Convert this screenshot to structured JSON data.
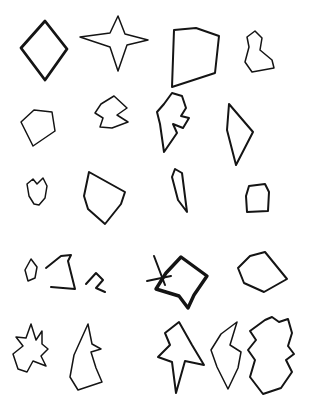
{
  "page": {
    "background_color": "#ffffff",
    "ink_color": "#141414",
    "width": 309,
    "height": 404,
    "rows": 5,
    "columns": 4,
    "shape_count": 20
  },
  "shapes": [
    {
      "id": "shape-r1c1",
      "name": "diamond",
      "row": 1,
      "column": 1,
      "stroke_weight": "bold",
      "closed": true,
      "bbox": [
        21,
        20,
        68,
        81
      ],
      "points": "45,21 67,49 45,80 21,48"
    },
    {
      "id": "shape-r1c2",
      "name": "four-point-star",
      "row": 1,
      "column": 2,
      "stroke_weight": "thin",
      "closed": true,
      "bbox": [
        79,
        14,
        150,
        73
      ],
      "points": "118,16 125,34 148,40 127,45 118,71 110,47 80,37 110,33"
    },
    {
      "id": "shape-r1c3",
      "name": "curved-quadrilateral",
      "row": 1,
      "column": 3,
      "stroke_weight": "med",
      "closed": true,
      "bbox": [
        169,
        27,
        222,
        90
      ],
      "points": "174,30 196,28 219,36 215,73 172,87"
    },
    {
      "id": "shape-r1c4",
      "name": "small-lobed-blob",
      "row": 1,
      "column": 4,
      "stroke_weight": "thin",
      "closed": true,
      "bbox": [
        243,
        29,
        278,
        75
      ],
      "points": "255,31 262,38 260,50 272,60 274,68 252,72 245,62 249,47 247,37"
    },
    {
      "id": "shape-r2c1",
      "name": "tilted-quadrilateral",
      "row": 2,
      "column": 1,
      "stroke_weight": "thin",
      "closed": true,
      "bbox": [
        18,
        106,
        58,
        149
      ],
      "points": "34,110 52,112 55,131 33,146 21,122"
    },
    {
      "id": "shape-r2c2",
      "name": "notched-arrow-blob",
      "row": 2,
      "column": 2,
      "stroke_weight": "thin",
      "closed": true,
      "bbox": [
        93,
        93,
        131,
        131
      ],
      "points": "114,96 127,108 117,115 128,122 112,128 100,127 103,118 95,113 101,104"
    },
    {
      "id": "shape-r2c3",
      "name": "double-lobe-with-inner-notch",
      "row": 2,
      "column": 3,
      "stroke_weight": "med",
      "closed": true,
      "bbox": [
        154,
        90,
        194,
        156
      ],
      "points": "172,93 182,96 186,108 181,116 189,118 183,128 173,124 177,133 164,152 160,124 157,112 164,104"
    },
    {
      "id": "shape-r2c4",
      "name": "narrow-triangle",
      "row": 2,
      "column": 4,
      "stroke_weight": "med",
      "closed": true,
      "bbox": [
        224,
        99,
        257,
        169
      ],
      "points": "229,104 253,132 236,165 227,130"
    },
    {
      "id": "shape-r3c1",
      "name": "small-hook-blob",
      "row": 3,
      "column": 1,
      "stroke_weight": "thin",
      "closed": true,
      "bbox": [
        23,
        175,
        51,
        208
      ],
      "points": "33,179 37,184 43,178 47,186 45,198 39,205 34,204 29,196 27,184"
    },
    {
      "id": "shape-r3c2",
      "name": "kite-pentagon",
      "row": 3,
      "column": 2,
      "stroke_weight": "med",
      "closed": true,
      "bbox": [
        80,
        168,
        129,
        228
      ],
      "points": "89,172 125,192 121,204 105,224 88,209 84,196"
    },
    {
      "id": "shape-r3c3",
      "name": "thin-sliver",
      "row": 3,
      "column": 3,
      "stroke_weight": "med",
      "closed": true,
      "bbox": [
        168,
        165,
        192,
        217
      ],
      "points": "175,169 182,173 187,212 178,200 172,177"
    },
    {
      "id": "shape-r3c4",
      "name": "rounded-rectangle",
      "row": 3,
      "column": 4,
      "stroke_weight": "med",
      "closed": true,
      "bbox": [
        241,
        181,
        274,
        216
      ],
      "points": "249,186 265,184 269,192 268,211 247,212 246,196"
    },
    {
      "id": "shape-r4c1",
      "name": "tiny-lozenge",
      "row": 4,
      "column": 1,
      "stroke_weight": "thin",
      "closed": true,
      "bbox": [
        23,
        256,
        41,
        284
      ],
      "points": "31,259 37,267 35,278 28,281 25,270"
    },
    {
      "id": "shape-r4c2",
      "name": "open-angular-sweep",
      "row": 4,
      "column": 2,
      "stroke_weight": "med",
      "closed": false,
      "bbox": [
        44,
        253,
        82,
        292
      ],
      "points": "46,268 61,256 71,255 68,261 75,289 51,287"
    },
    {
      "id": "shape-r4c3",
      "name": "small-open-hook",
      "row": 4,
      "column": 3,
      "stroke_weight": "med",
      "closed": false,
      "bbox": [
        85,
        271,
        108,
        296
      ],
      "points": "86,284 96,273 103,280 96,288 105,292"
    },
    {
      "id": "shape-r4c4",
      "name": "bold-polygon-with-tail",
      "row": 4,
      "column": 4,
      "stroke_weight": "xbold",
      "closed": true,
      "bbox": [
        147,
        252,
        212,
        310
      ],
      "points": "181,257 207,276 194,295 188,308 179,296 156,289 166,273"
    },
    {
      "id": "shape-r4c4-tail",
      "name": "crossing-tail-stroke",
      "row": 4,
      "column": 4,
      "stroke_weight": "med",
      "closed": false,
      "bbox": [
        146,
        254,
        174,
        286
      ],
      "points": "154,256 165,285"
    },
    {
      "id": "shape-r4c4-tail2",
      "name": "crossing-tail-stroke-horizontal",
      "row": 4,
      "column": 4,
      "stroke_weight": "med",
      "closed": false,
      "bbox": [
        146,
        275,
        172,
        284
      ],
      "points": "147,281 171,276"
    },
    {
      "id": "shape-r4c5",
      "name": "fan-quadrilateral",
      "row": 4,
      "column": 5,
      "stroke_weight": "med",
      "closed": true,
      "bbox": [
        235,
        251,
        290,
        295
      ],
      "points": "250,256 265,252 287,279 264,292 244,283 238,268"
    },
    {
      "id": "shape-r5c1",
      "name": "jagged-star-blob",
      "row": 5,
      "column": 1,
      "stroke_weight": "thin",
      "closed": true,
      "bbox": [
        11,
        320,
        52,
        382
      ],
      "points": "31,324 36,340 42,331 42,344 48,349 41,356 46,366 33,361 27,372 18,369 13,354 23,346 16,337 26,338"
    },
    {
      "id": "shape-r5c2",
      "name": "tall-spike-blob",
      "row": 5,
      "column": 2,
      "stroke_weight": "thin",
      "closed": true,
      "bbox": [
        66,
        320,
        106,
        392
      ],
      "points": "88,324 92,344 101,349 91,352 96,368 102,382 78,390 70,377 74,355"
    },
    {
      "id": "shape-r5c3",
      "name": "five-point-star-blob",
      "row": 5,
      "column": 3,
      "stroke_weight": "med",
      "closed": true,
      "bbox": [
        156,
        318,
        206,
        396
      ],
      "points": "179,322 192,345 204,365 185,361 176,393 172,362 158,357 170,345 165,333"
    },
    {
      "id": "shape-r5c4",
      "name": "v-notched-blob",
      "row": 5,
      "column": 4,
      "stroke_weight": "thin",
      "closed": true,
      "bbox": [
        209,
        318,
        248,
        392
      ],
      "points": "237,322 230,345 241,352 238,368 228,389 217,367 211,350 221,334"
    },
    {
      "id": "shape-r5c5",
      "name": "large-lumpy-blob",
      "row": 5,
      "column": 5,
      "stroke_weight": "med",
      "closed": true,
      "bbox": [
        245,
        315,
        296,
        398
      ],
      "points": "265,320 272,317 279,322 288,319 292,333 288,346 294,354 286,360 292,372 281,388 263,394 250,377 255,360 248,350 256,340 250,331"
    }
  ]
}
